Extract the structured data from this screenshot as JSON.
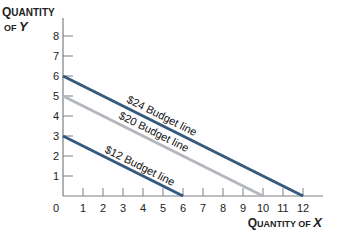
{
  "chart_data": {
    "type": "line",
    "title": "",
    "xlabel": "Quantity of X",
    "ylabel": "Quantity of Y",
    "xlim": [
      0,
      12
    ],
    "ylim": [
      0,
      8
    ],
    "x_ticks": [
      "0",
      "1",
      "2",
      "3",
      "4",
      "5",
      "6",
      "7",
      "8",
      "9",
      "10",
      "11",
      "12"
    ],
    "y_ticks": [
      "1",
      "2",
      "3",
      "4",
      "5",
      "6",
      "7",
      "8"
    ],
    "grid": false,
    "series": [
      {
        "name": "$24 Budget line",
        "x": [
          0,
          12
        ],
        "y": [
          6,
          0
        ],
        "color": "#35597e"
      },
      {
        "name": "$20 Budget line",
        "x": [
          0,
          10
        ],
        "y": [
          5,
          0
        ],
        "color": "#b4b8bd"
      },
      {
        "name": "$12 Budget line",
        "x": [
          0,
          6
        ],
        "y": [
          3,
          0
        ],
        "color": "#35597e"
      }
    ]
  },
  "axes": {
    "x_title_main": "Quantity of",
    "x_title_var": "X",
    "y_title_line1": "Quantity",
    "y_title_line2_pre": "of",
    "y_title_var": "Y",
    "origin_label": "0"
  },
  "labels": {
    "l24": "$24 Budget line",
    "l20": "$20 Budget line",
    "l12": "$12 Budget line"
  }
}
